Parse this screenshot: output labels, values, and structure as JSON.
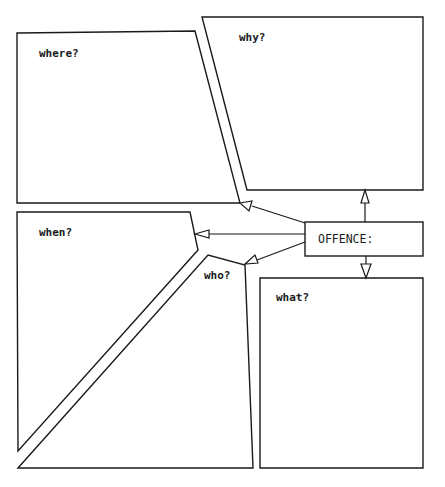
{
  "diagram": {
    "center": {
      "label": "OFFENCE:"
    },
    "boxes": [
      {
        "id": "where",
        "label": "where?"
      },
      {
        "id": "why",
        "label": "why?"
      },
      {
        "id": "when",
        "label": "when?"
      },
      {
        "id": "who",
        "label": "who?"
      },
      {
        "id": "what",
        "label": "what?"
      }
    ],
    "arrows": [
      {
        "from": "OFFENCE:",
        "to": "why?"
      },
      {
        "from": "OFFENCE:",
        "to": "where?"
      },
      {
        "from": "OFFENCE:",
        "to": "when?"
      },
      {
        "from": "OFFENCE:",
        "to": "who?"
      },
      {
        "from": "OFFENCE:",
        "to": "what?"
      }
    ],
    "colors": {
      "stroke": "#1a1a1a",
      "background": "#ffffff"
    }
  }
}
